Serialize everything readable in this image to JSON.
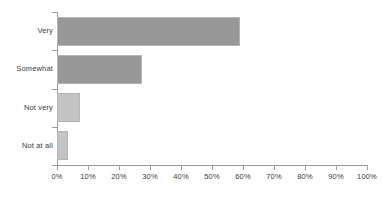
{
  "chart_data": {
    "type": "bar",
    "orientation": "horizontal",
    "title": "",
    "subtitle": "",
    "xlabel": "",
    "ylabel": "",
    "categories": [
      "Very",
      "Somewhat",
      "Not very",
      "Not at all"
    ],
    "values": [
      59,
      27.5,
      7.5,
      3.5
    ],
    "value_labels": [
      "59%",
      "27.5%",
      "7.5%",
      "3.5%"
    ],
    "xlim": [
      0,
      100
    ],
    "xticks": [
      0,
      10,
      20,
      30,
      40,
      50,
      60,
      70,
      80,
      90,
      100
    ],
    "xtick_labels": [
      "0%",
      "10%",
      "20%",
      "30%",
      "40%",
      "50%",
      "60%",
      "70%",
      "80%",
      "90%",
      "100%"
    ],
    "grid": false,
    "legend": false,
    "legend_position": "none",
    "annotations": [],
    "bar_colors": [
      "#989898",
      "#989898",
      "#c4c4c4",
      "#c4c4c4"
    ],
    "bar_border_color": "#b4b4b4",
    "axis_color": "#9a9a9a",
    "text_color": "#3b3b3b",
    "background_color": "#ffffff"
  },
  "axis": {
    "y_ticks": [
      {
        "label": "Very"
      },
      {
        "label": "Somewhat"
      },
      {
        "label": "Not very"
      },
      {
        "label": "Not at all"
      }
    ]
  }
}
